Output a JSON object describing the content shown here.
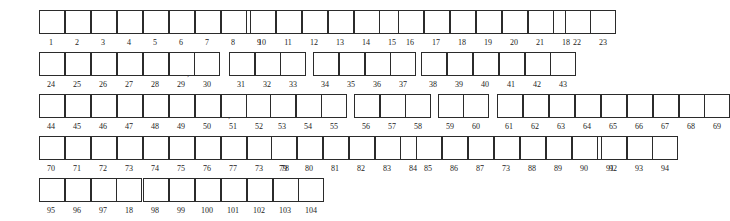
{
  "document": {
    "title": "Numbered box entry grid",
    "cell_width_px": 26,
    "cell_height_px": 24,
    "border_color": "#2b2b2b",
    "background_color": "#ffffff",
    "caption_color": "#1c1c1c"
  },
  "rows": [
    {
      "id": "row-1",
      "top": 10,
      "groups": [
        {
          "id": "r1g1",
          "left": 38,
          "labels": [
            "1",
            "2",
            "3",
            "4",
            "5",
            "6",
            "7",
            "8",
            "9"
          ]
        },
        {
          "id": "r1g2",
          "left": 249,
          "labels": [
            "10",
            "11",
            "12",
            "13",
            "14",
            "15"
          ]
        },
        {
          "id": "r1g3",
          "left": 397,
          "labels": [
            "16",
            "17",
            "18",
            "19",
            "20",
            "21",
            "18"
          ]
        },
        {
          "id": "r1g4",
          "left": 564,
          "labels": [
            "22",
            "23"
          ]
        }
      ],
      "marks": []
    },
    {
      "id": "row-2",
      "top": 52,
      "groups": [
        {
          "id": "r2g1",
          "left": 38,
          "labels": [
            "24",
            "25",
            "26",
            "27",
            "28",
            "29",
            "30"
          ]
        },
        {
          "id": "r2g2",
          "left": 228,
          "labels": [
            "31",
            "32",
            "33"
          ]
        },
        {
          "id": "r2g3",
          "left": 312,
          "labels": [
            "34",
            "35",
            "36",
            "37"
          ]
        },
        {
          "id": "r2g4",
          "left": 420,
          "labels": [
            "38",
            "39",
            "40",
            "41",
            "42",
            "43"
          ]
        }
      ],
      "marks": [
        {
          "id": "r2m1",
          "left": 187,
          "glyph": ","
        }
      ]
    },
    {
      "id": "row-3",
      "top": 94,
      "groups": [
        {
          "id": "r3g1",
          "left": 38,
          "labels": [
            "44",
            "45",
            "46",
            "47",
            "48",
            "49",
            "50",
            "51",
            "52"
          ]
        },
        {
          "id": "r3g2",
          "left": 269,
          "labels": [
            "53",
            "54",
            "55"
          ]
        },
        {
          "id": "r3g3",
          "left": 353,
          "labels": [
            "56",
            "57",
            "58"
          ]
        },
        {
          "id": "r3g4",
          "left": 437,
          "labels": [
            "59",
            "60"
          ]
        },
        {
          "id": "r3g5",
          "left": 496,
          "labels": [
            "61",
            "62",
            "63",
            "64",
            "65",
            "66",
            "67",
            "68",
            "69"
          ]
        }
      ],
      "marks": [
        {
          "id": "r3m1",
          "left": 228,
          "glyph": ","
        }
      ]
    },
    {
      "id": "row-4",
      "top": 136,
      "groups": [
        {
          "id": "r4g1",
          "left": 38,
          "labels": [
            "70",
            "71",
            "72",
            "73",
            "74",
            "75",
            "76",
            "77",
            "73",
            "78"
          ]
        },
        {
          "id": "r4g2",
          "left": 270,
          "labels": [
            "79",
            "80",
            "81",
            "82",
            "83",
            "84"
          ]
        },
        {
          "id": "r4g3",
          "left": 415,
          "labels": [
            "85",
            "86",
            "87",
            "73",
            "88",
            "89",
            "90",
            "91"
          ]
        },
        {
          "id": "r4g4",
          "left": 600,
          "labels": [
            "92",
            "93",
            "94"
          ]
        }
      ],
      "marks": []
    },
    {
      "id": "row-5",
      "top": 178,
      "groups": [
        {
          "id": "r5g1",
          "left": 38,
          "labels": [
            "95",
            "96",
            "97",
            "18"
          ]
        },
        {
          "id": "r5g2",
          "left": 142,
          "labels": [
            "98",
            "99",
            "100",
            "101",
            "102",
            "103",
            "104"
          ]
        }
      ],
      "marks": [
        {
          "id": "r5m1",
          "left": 293,
          "glyph": "."
        }
      ]
    }
  ]
}
